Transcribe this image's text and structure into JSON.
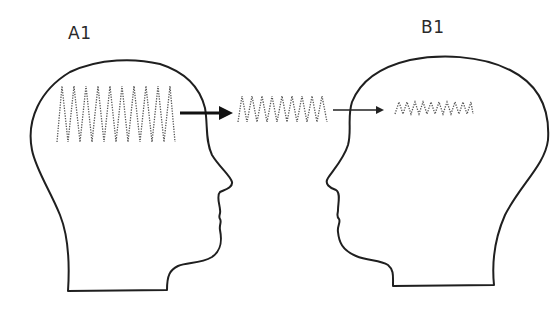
{
  "diagram": {
    "labels": {
      "head_a": "A1",
      "head_b": "B1"
    },
    "colors": {
      "outline": "#1f1f1f",
      "wave": "#555555",
      "background": "#ffffff"
    },
    "elements": {
      "head_a": {
        "facing": "right"
      },
      "head_b": {
        "facing": "left"
      },
      "wave_source": {
        "location": "inside head A",
        "amplitude": "large",
        "peaks": 10
      },
      "wave_transit": {
        "location": "between heads",
        "amplitude": "medium",
        "peaks": 9
      },
      "wave_received": {
        "location": "inside head B",
        "amplitude": "small",
        "peaks": 9
      },
      "arrow_1": {
        "from": "wave_source",
        "to": "wave_transit",
        "weight": "thick"
      },
      "arrow_2": {
        "from": "wave_transit",
        "to": "wave_received",
        "weight": "thin"
      }
    }
  }
}
